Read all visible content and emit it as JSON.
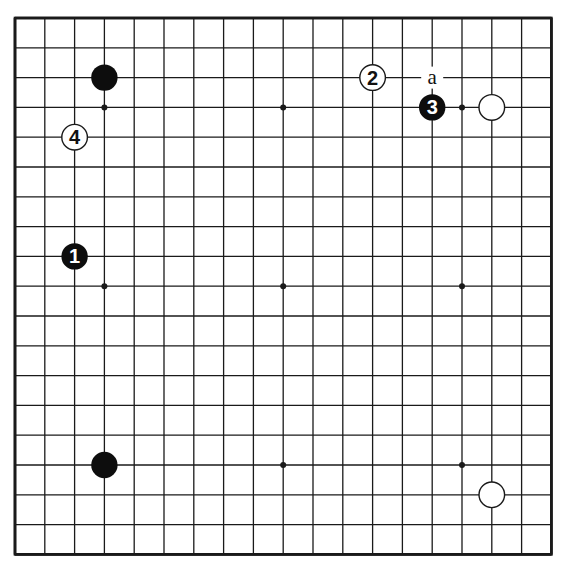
{
  "diagram": {
    "type": "go-board",
    "size": 19,
    "origin": {
      "x": 15,
      "y": 18
    },
    "spacing": 29.8,
    "colors": {
      "background": "#ffffff",
      "line": "#1a1a1a",
      "black_stone": "#0d0d0d",
      "white_stone": "#ffffff",
      "label_on_black": "#ffffff",
      "label_on_white": "#111111"
    },
    "star_points": [
      {
        "col": 3,
        "row": 3
      },
      {
        "col": 9,
        "row": 3
      },
      {
        "col": 15,
        "row": 3
      },
      {
        "col": 3,
        "row": 9
      },
      {
        "col": 9,
        "row": 9
      },
      {
        "col": 15,
        "row": 9
      },
      {
        "col": 3,
        "row": 15
      },
      {
        "col": 9,
        "row": 15
      },
      {
        "col": 15,
        "row": 15
      }
    ],
    "stones": [
      {
        "color": "black",
        "col": 3,
        "row": 2,
        "label": ""
      },
      {
        "color": "black",
        "col": 3,
        "row": 15,
        "label": ""
      },
      {
        "color": "white",
        "col": 16,
        "row": 3,
        "label": ""
      },
      {
        "color": "white",
        "col": 16,
        "row": 16,
        "label": ""
      },
      {
        "color": "black",
        "col": 2,
        "row": 8,
        "label": "1"
      },
      {
        "color": "white",
        "col": 12,
        "row": 2,
        "label": "2"
      },
      {
        "color": "black",
        "col": 14,
        "row": 3,
        "label": "3"
      },
      {
        "color": "white",
        "col": 2,
        "row": 4,
        "label": "4"
      }
    ],
    "marks": [
      {
        "col": 14,
        "row": 2,
        "label": "a"
      }
    ]
  }
}
